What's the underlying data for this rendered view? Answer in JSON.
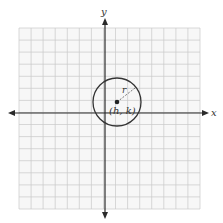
{
  "diagram": {
    "type": "circle-on-coordinate-plane",
    "axes": {
      "x_label": "x",
      "y_label": "y"
    },
    "circle": {
      "center_label": "(h, k)",
      "radius_label": "r"
    },
    "grid": {
      "cells_x": 15,
      "cells_y": 15
    },
    "colors": {
      "grid": "#c8c8c8",
      "axis": "#2a2a2a",
      "circle": "#333333",
      "background": "#f7f7f7"
    }
  }
}
